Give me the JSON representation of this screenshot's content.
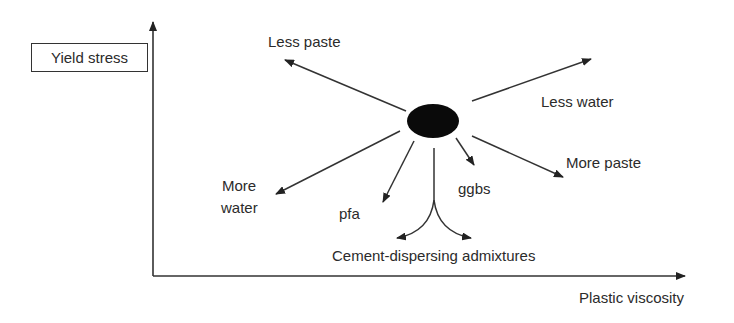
{
  "diagram": {
    "y_axis_label": "Yield stress",
    "x_axis_label": "Plastic viscosity",
    "center_node": "current mix (filled ellipse)",
    "effects": [
      {
        "id": "less-paste",
        "label": "Less paste",
        "direction": "up-left"
      },
      {
        "id": "less-water",
        "label": "Less water",
        "direction": "up-right"
      },
      {
        "id": "more-paste",
        "label": "More paste",
        "direction": "down-right"
      },
      {
        "id": "ggbs",
        "label": "ggbs",
        "direction": "down-slight-right"
      },
      {
        "id": "more-water",
        "label_line1": "More",
        "label_line2": "water",
        "direction": "down-left"
      },
      {
        "id": "pfa",
        "label": "pfa",
        "direction": "down-slight-left"
      },
      {
        "id": "cement-dispersing",
        "label": "Cement-dispersing admixtures",
        "direction": "down, splitting left and right"
      }
    ]
  }
}
